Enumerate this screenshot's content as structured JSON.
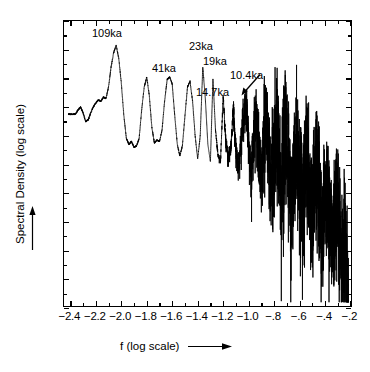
{
  "chart_data": {
    "type": "line",
    "title": "",
    "xlabel": "f (log scale)",
    "ylabel": "Spectral Density (log scale)",
    "xlim": [
      -2.45,
      -0.18
    ],
    "ylim": [
      -20,
      0
    ],
    "grid": false,
    "legend": null,
    "xticks": [
      "-2.4",
      "-2.2",
      "-2.0",
      "-1.8",
      "-1.6",
      "-1.4",
      "-1.2",
      "-1.0",
      "-.8",
      "-.6",
      "-.4",
      "-.2"
    ],
    "xtick_values": [
      -2.4,
      -2.2,
      -2.0,
      -1.8,
      -1.6,
      -1.4,
      -1.2,
      -1.0,
      -0.8,
      -0.6,
      -0.4,
      -0.2
    ],
    "yticks": [
      "0",
      "-2",
      "-4",
      "-6",
      "-8",
      "-10",
      "-12",
      "-14",
      "-16",
      "-18",
      "-20"
    ],
    "ytick_values": [
      0,
      -2,
      -4,
      -6,
      -8,
      -10,
      -12,
      -14,
      -16,
      -18,
      -20
    ],
    "annotations": [
      {
        "label": "109ka",
        "x": -2.04,
        "peak_y": -1.7
      },
      {
        "label": "41ka",
        "x": -1.61,
        "peak_y": -3.9
      },
      {
        "label": "23ka",
        "x": -1.36,
        "peak_y": -3.2
      },
      {
        "label": "19ka",
        "x": -1.28,
        "peak_y": -4.0
      },
      {
        "label": "14.7ka",
        "x": -1.17,
        "peak_y": -5.2
      },
      {
        "label": "10.4ka",
        "x": -1.02,
        "peak_y": -5.6
      }
    ],
    "series": [
      {
        "name": "spectral density",
        "description": "Power spectrum: resolved low-frequency peaks at Milankovitch periods on the left, dense unresolved high-frequency noise band decaying toward the right.",
        "x": [
          -2.36,
          -2.34,
          -2.32,
          -2.3,
          -2.28,
          -2.26,
          -2.24,
          -2.22,
          -2.2,
          -2.18,
          -2.16,
          -2.14,
          -2.12,
          -2.1,
          -2.08,
          -2.06,
          -2.04,
          -2.02,
          -2.0,
          -1.98,
          -1.96,
          -1.94,
          -1.92,
          -1.9,
          -1.88,
          -1.86,
          -1.84,
          -1.82,
          -1.8,
          -1.78,
          -1.76,
          -1.74,
          -1.72,
          -1.7,
          -1.68,
          -1.66,
          -1.64,
          -1.62,
          -1.6,
          -1.58,
          -1.56,
          -1.54,
          -1.52,
          -1.5,
          -1.48,
          -1.46,
          -1.44,
          -1.42,
          -1.4,
          -1.38,
          -1.36,
          -1.34,
          -1.32,
          -1.3,
          -1.28,
          -1.26,
          -1.24,
          -1.22,
          -1.2,
          -1.18,
          -1.16,
          -1.14,
          -1.12,
          -1.1,
          -1.08,
          -1.06,
          -1.04,
          -1.02,
          -1.0,
          -0.98,
          -0.96,
          -0.94,
          -0.92,
          -0.9,
          -0.88,
          -0.86,
          -0.84,
          -0.82,
          -0.8,
          -0.78,
          -0.76,
          -0.74,
          -0.72,
          -0.7,
          -0.68,
          -0.66,
          -0.64,
          -0.62,
          -0.6,
          -0.58,
          -0.56,
          -0.54,
          -0.52,
          -0.5,
          -0.48,
          -0.46,
          -0.44,
          -0.42,
          -0.4,
          -0.38,
          -0.36,
          -0.34,
          -0.32,
          -0.3,
          -0.28,
          -0.26,
          -0.24,
          -0.22
        ],
        "y": [
          -6.5,
          -6.2,
          -6.0,
          -6.4,
          -7.0,
          -6.9,
          -6.4,
          -6.0,
          -5.7,
          -5.5,
          -5.6,
          -5.3,
          -5.4,
          -4.6,
          -3.2,
          -2.2,
          -1.7,
          -2.6,
          -4.3,
          -6.6,
          -8.2,
          -8.6,
          -8.4,
          -8.8,
          -8.7,
          -8.2,
          -6.2,
          -4.6,
          -3.9,
          -5.2,
          -7.4,
          -8.5,
          -8.3,
          -8.4,
          -7.6,
          -5.6,
          -4.1,
          -3.9,
          -4.4,
          -6.6,
          -8.6,
          -9.4,
          -8.7,
          -6.6,
          -4.6,
          -4.2,
          -5.6,
          -8.0,
          -9.6,
          -8.0,
          -3.2,
          -5.4,
          -8.6,
          -9.8,
          -4.0,
          -7.6,
          -9.4,
          -9.7,
          -5.2,
          -8.2,
          -9.6,
          -9.0,
          -6.0,
          -9.0,
          -10.2,
          -8.4,
          -6.8,
          -5.6,
          -8.6,
          -10.4,
          -8.0,
          -6.2,
          -9.2,
          -11.0,
          -7.6,
          -6.4,
          -9.8,
          -11.4,
          -8.2,
          -6.6,
          -10.0,
          -11.8,
          -8.6,
          -7.2,
          -10.6,
          -12.4,
          -9.4,
          -8.0,
          -11.4,
          -13.0,
          -10.2,
          -9.0,
          -12.2,
          -13.8,
          -11.0,
          -10.0,
          -13.0,
          -14.6,
          -12.0,
          -11.2,
          -14.0,
          -15.6,
          -13.2,
          -12.6,
          -15.4,
          -16.8,
          -14.6,
          -18.4
        ]
      }
    ]
  },
  "axes": {
    "y_title": "Spectral Density (log scale)",
    "x_title": "f (log scale)"
  },
  "icons": {
    "y_arrow": "up-arrow-icon",
    "x_arrow": "right-arrow-icon",
    "peak_pointer": "diagonal-arrow-icon"
  }
}
